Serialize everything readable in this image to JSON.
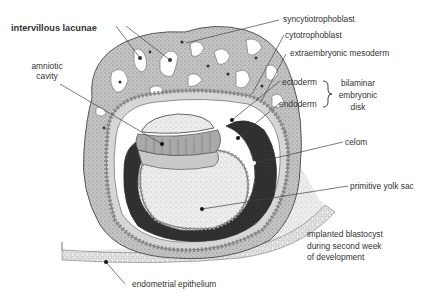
{
  "diagram": {
    "title_caption": [
      "implanted blastocyst",
      "during second week",
      "of development"
    ],
    "labels": {
      "intervillous_lacunae": "intervillous lacunae",
      "syncytiotrophoblast": "syncytiotrophoblast",
      "cytotrophoblast": "cytotrophoblast",
      "extraembryonic_mesoderm": "extraembryonic mesoderm",
      "amniotic_cavity": [
        "amniotic",
        "cavity"
      ],
      "ectoderm": "ectoderm",
      "endoderm": "endoderm",
      "bilaminar_embryonic_disk": [
        "bilaminar",
        "embryonic",
        "disk"
      ],
      "celom": "celom",
      "primitive_yolk_sac": "primitive yolk sac",
      "endometrial_epithelium": "endometrial epithelium"
    },
    "colors": {
      "background": "#ffffff",
      "stipple_gray": "#b9b9b9",
      "dark_celom": "#2c2c2c",
      "line": "#444444",
      "text": "#333333"
    }
  }
}
